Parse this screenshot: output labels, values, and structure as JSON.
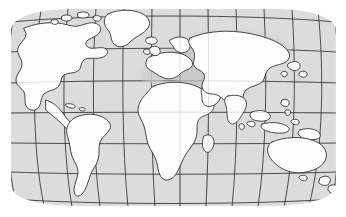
{
  "figure": {
    "kind": "world-map",
    "title": "World Map",
    "projection": "pseudocylindrical (Robinson-style) graticule",
    "has_text_labels": false,
    "width": 346,
    "height": 217
  },
  "colors": {
    "page_background": "#ffffff",
    "ocean_fill": "#dcdcdc",
    "land_fill": "#fdfdfd",
    "coastline_stroke": "#2b2b2b",
    "graticule_stroke": "#3a3a3a",
    "highlight_region_fill": "#c6c6c6",
    "highlight_region_fill_soft": "#cfcfcf"
  },
  "map_frame": {
    "left": 10,
    "top": 8,
    "right": 337,
    "bottom": 207
  },
  "graticule": {
    "meridian_count": 13,
    "parallel_count": 7,
    "meridian_spacing_degrees": 30,
    "parallel_spacing_degrees": 30,
    "stroke_width": 0.9,
    "curved_meridians": true,
    "straight_parallels": true
  },
  "highlight_region": {
    "name": "northern-eurasia-shaded-area",
    "label": "Russia / Central Asia shaded region",
    "fill": "#c6c6c6",
    "opacity": 0.85
  },
  "landmasses": [
    {
      "name": "north-america",
      "label": "North America"
    },
    {
      "name": "greenland",
      "label": "Greenland"
    },
    {
      "name": "south-america",
      "label": "South America"
    },
    {
      "name": "africa",
      "label": "Africa"
    },
    {
      "name": "europe",
      "label": "Europe"
    },
    {
      "name": "asia",
      "label": "Asia"
    },
    {
      "name": "india",
      "label": "India"
    },
    {
      "name": "arabia",
      "label": "Arabian Peninsula"
    },
    {
      "name": "madagascar",
      "label": "Madagascar"
    },
    {
      "name": "indonesia",
      "label": "Indonesian Archipelago"
    },
    {
      "name": "japan",
      "label": "Japan"
    },
    {
      "name": "australia",
      "label": "Australia"
    },
    {
      "name": "new-zealand",
      "label": "New Zealand"
    },
    {
      "name": "british-isles",
      "label": "British Isles"
    },
    {
      "name": "iceland",
      "label": "Iceland"
    },
    {
      "name": "sri-lanka",
      "label": "Sri Lanka"
    },
    {
      "name": "philippines",
      "label": "Philippines"
    },
    {
      "name": "papua-new-guinea",
      "label": "Papua New Guinea"
    },
    {
      "name": "caribbean",
      "label": "Caribbean Islands"
    },
    {
      "name": "arctic-islands",
      "label": "Canadian Arctic Islands"
    }
  ]
}
